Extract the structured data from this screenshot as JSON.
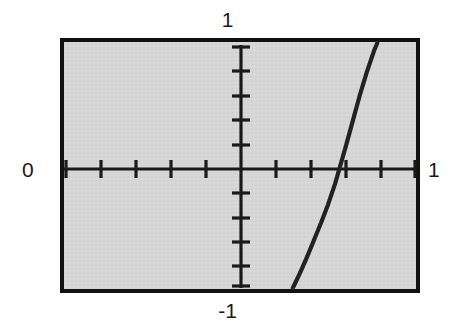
{
  "figure": {
    "title": "",
    "frame": {
      "left": 60,
      "top": 38,
      "right": 420,
      "bottom": 293,
      "border_color": "#111111",
      "border_width": 4,
      "background_color": "#d6d6d6"
    },
    "labels": {
      "x_min": "0",
      "x_max": "1",
      "y_max": "1",
      "y_min": "-1"
    },
    "colors": {
      "axis": "#1a1a1a",
      "curve": "#222222",
      "plot_background": "#d6d6d6",
      "page_background": "#ffffff",
      "text": "#1a1a1a"
    }
  },
  "chart_data": {
    "type": "line",
    "title": "",
    "xlabel": "",
    "ylabel": "",
    "xlim": [
      -1,
      1
    ],
    "ylim": [
      -1,
      1
    ],
    "grid": false,
    "legend": null,
    "axis_style": "centered-cross-with-ticks",
    "x_tick_labels": [
      "0",
      "1"
    ],
    "x_tick_label_positions": [
      -1,
      1
    ],
    "y_tick_labels": [
      "-1",
      "1"
    ],
    "y_tick_label_positions": [
      -1,
      1
    ],
    "x_ticks": [
      -1.0,
      -0.8,
      -0.6,
      -0.4,
      -0.2,
      0.2,
      0.4,
      0.6,
      0.8,
      1.0
    ],
    "y_ticks": [
      -1.0,
      -0.8,
      -0.6,
      -0.4,
      -0.2,
      0.2,
      0.4,
      0.6,
      0.8,
      1.0
    ],
    "x_root": 0.57,
    "series": [
      {
        "name": "curve",
        "x": [
          0.3,
          0.34,
          0.38,
          0.42,
          0.46,
          0.5,
          0.54,
          0.57,
          0.6,
          0.64,
          0.68,
          0.72,
          0.76,
          0.78
        ],
        "y": [
          -1.0,
          -0.88,
          -0.75,
          -0.61,
          -0.47,
          -0.32,
          -0.15,
          0.0,
          0.15,
          0.36,
          0.57,
          0.76,
          0.93,
          1.0
        ]
      }
    ]
  }
}
